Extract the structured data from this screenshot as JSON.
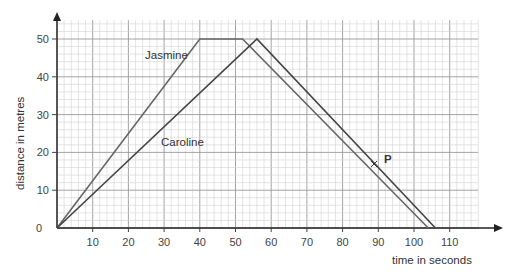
{
  "chart_data": {
    "type": "line",
    "title": "",
    "xlabel": "time in seconds",
    "ylabel": "distance in metres",
    "x_ticks": [
      10,
      20,
      30,
      40,
      50,
      60,
      70,
      80,
      90,
      100,
      110
    ],
    "y_ticks": [
      0,
      10,
      20,
      30,
      40,
      50
    ],
    "xlim": [
      0,
      118
    ],
    "ylim": [
      0,
      55
    ],
    "grid": true,
    "series": [
      {
        "name": "Jasmine",
        "x": [
          0,
          40,
          52,
          104
        ],
        "y": [
          0,
          50,
          50,
          0
        ],
        "color": "#666666"
      },
      {
        "name": "Caroline",
        "x": [
          0,
          56,
          106
        ],
        "y": [
          0,
          50,
          0
        ],
        "color": "#444444"
      }
    ],
    "annotations": [
      {
        "label": "P",
        "x": 88,
        "y": 16,
        "marker": "cross"
      },
      {
        "label": "Jasmine",
        "x": 30,
        "y": 46
      },
      {
        "label": "Caroline",
        "x": 34,
        "y": 22
      }
    ]
  },
  "labels": {
    "xlabel": "time in seconds",
    "ylabel": "distance in metres",
    "jasmine": "Jasmine",
    "caroline": "Caroline",
    "point_p": "P",
    "origin": "0"
  }
}
